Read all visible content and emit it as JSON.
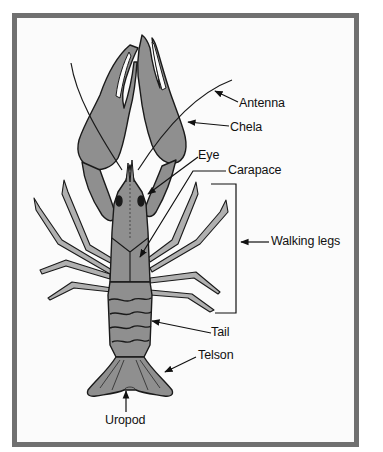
{
  "diagram": {
    "colors": {
      "frame_border": "#707070",
      "background": "#fbfbfb",
      "body_fill": "#8f8f8f",
      "outline": "#1a1a1a"
    },
    "labels": [
      {
        "id": "antenna",
        "text": "Antenna"
      },
      {
        "id": "chela",
        "text": "Chela"
      },
      {
        "id": "eye",
        "text": "Eye"
      },
      {
        "id": "carapace",
        "text": "Carapace"
      },
      {
        "id": "walking_legs",
        "text": "Walking legs"
      },
      {
        "id": "tail",
        "text": "Tail"
      },
      {
        "id": "telson",
        "text": "Telson"
      },
      {
        "id": "uropod",
        "text": "Uropod"
      }
    ]
  }
}
